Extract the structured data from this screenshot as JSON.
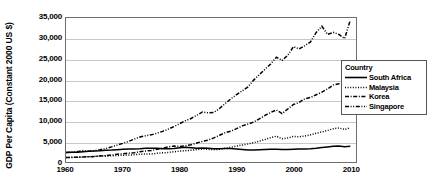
{
  "chart_data": {
    "type": "line",
    "title": "",
    "xlabel": "",
    "ylabel": "GDP Per Capita (Constant  2000 US $)",
    "xlim": [
      1960,
      2011
    ],
    "ylim": [
      0,
      35000
    ],
    "grid": true,
    "legend_position": "right",
    "legend_title": "Country",
    "x_ticks": [
      1960,
      1970,
      1980,
      1990,
      2000,
      2010
    ],
    "x_tick_labels": [
      "1960",
      "1970",
      "1980",
      "1990",
      "2000",
      "2010"
    ],
    "y_ticks": [
      0,
      5000,
      10000,
      15000,
      20000,
      25000,
      30000,
      35000
    ],
    "y_tick_labels": [
      "0",
      "5,000",
      "10,000",
      "15,000",
      "20,000",
      "25,000",
      "30,000",
      "35,000"
    ],
    "x": [
      1960,
      1961,
      1962,
      1963,
      1964,
      1965,
      1966,
      1967,
      1968,
      1969,
      1970,
      1971,
      1972,
      1973,
      1974,
      1975,
      1976,
      1977,
      1978,
      1979,
      1980,
      1981,
      1982,
      1983,
      1984,
      1985,
      1986,
      1987,
      1988,
      1989,
      1990,
      1991,
      1992,
      1993,
      1994,
      1995,
      1996,
      1997,
      1998,
      1999,
      2000,
      2001,
      2002,
      2003,
      2004,
      2005,
      2006,
      2007,
      2008,
      2009,
      2010
    ],
    "series": [
      {
        "name": "South Africa",
        "style": "solid",
        "values": [
          2300,
          2340,
          2390,
          2500,
          2600,
          2680,
          2740,
          2880,
          2900,
          3000,
          3080,
          3150,
          3140,
          3220,
          3330,
          3330,
          3320,
          3240,
          3250,
          3290,
          3450,
          3570,
          3490,
          3350,
          3430,
          3320,
          3230,
          3230,
          3290,
          3280,
          3170,
          3060,
          2930,
          2920,
          2960,
          3010,
          3080,
          3090,
          3040,
          3030,
          3110,
          3140,
          3180,
          3230,
          3350,
          3500,
          3660,
          3810,
          3880,
          3730,
          3800
        ]
      },
      {
        "name": "Malaysia",
        "style": "dotted",
        "values": [
          1100,
          1140,
          1180,
          1250,
          1290,
          1380,
          1440,
          1460,
          1500,
          1580,
          1640,
          1690,
          1760,
          1880,
          1960,
          1940,
          2110,
          2220,
          2330,
          2490,
          2640,
          2760,
          2850,
          2990,
          3180,
          3060,
          3000,
          3110,
          3330,
          3570,
          3870,
          4130,
          4380,
          4700,
          5060,
          5480,
          5920,
          6270,
          5680,
          5820,
          6230,
          6130,
          6320,
          6600,
          6990,
          7310,
          7670,
          8080,
          8270,
          7890,
          8350
        ]
      },
      {
        "name": "Korea",
        "style": "dashdot",
        "values": [
          1100,
          1120,
          1140,
          1230,
          1290,
          1340,
          1480,
          1550,
          1700,
          1880,
          2000,
          2140,
          2230,
          2510,
          2670,
          2790,
          3080,
          3370,
          3670,
          3880,
          3760,
          3960,
          4190,
          4630,
          5020,
          5320,
          5860,
          6490,
          7140,
          7500,
          8100,
          8780,
          9210,
          9700,
          10480,
          11330,
          12040,
          12650,
          11770,
          12890,
          13980,
          14460,
          15390,
          15680,
          16350,
          16990,
          17780,
          18700,
          19000,
          18950,
          19800
        ]
      },
      {
        "name": "Singapore",
        "style": "dashdotdot",
        "values": [
          2300,
          2420,
          2500,
          2780,
          2590,
          2760,
          2980,
          3280,
          3670,
          4110,
          4540,
          4990,
          5570,
          6070,
          6380,
          6600,
          7000,
          7450,
          8010,
          8620,
          9330,
          10040,
          10580,
          11350,
          12160,
          11950,
          12040,
          13000,
          14220,
          15350,
          16380,
          17310,
          18250,
          19900,
          21250,
          22540,
          23830,
          25450,
          24700,
          25930,
          28030,
          27470,
          28290,
          29200,
          31500,
          33000,
          31000,
          31500,
          31000,
          30000,
          34500
        ]
      }
    ]
  },
  "legend": {
    "title": "Country",
    "entries": [
      {
        "label": "South Africa",
        "style": "solid"
      },
      {
        "label": "Malaysia",
        "style": "dotted"
      },
      {
        "label": "Korea",
        "style": "dashdot"
      },
      {
        "label": "Singapore",
        "style": "dashdotdot"
      }
    ]
  }
}
